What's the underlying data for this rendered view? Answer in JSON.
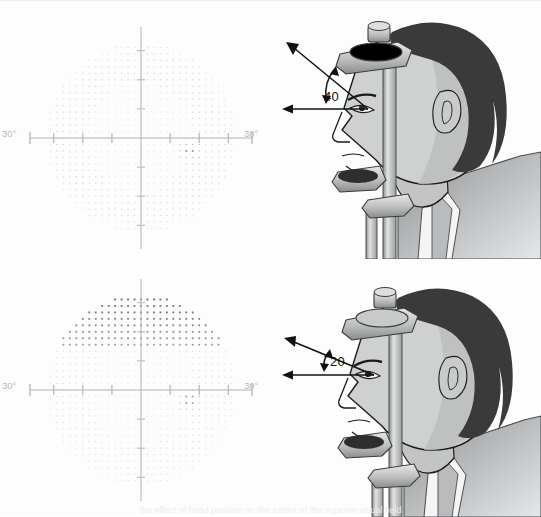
{
  "figure": {
    "background": "#fdfdfd",
    "caption_cut_off": "the effect of head position on the extent of the superior visual field"
  },
  "colors": {
    "axis": "#b4b4b4",
    "degree_label": "#b9b9b9",
    "dot_light": "#d8d8d8",
    "dot_mid": "#a8a8a8",
    "dot_dark": "#6e6e6e",
    "dot_darkest": "#4a4a4a",
    "skin": "#cfd0d0",
    "skin_shadow": "#a9abab",
    "hair": "#3a3a3a",
    "suit": "#9a9c9e",
    "shirt": "#f2f2f2",
    "metal_light": "#dcdcdc",
    "metal_mid": "#b0b2b2",
    "metal_dark": "#7d7f7f",
    "outline": "#1a1a1a",
    "annotation": "#111111"
  },
  "panels": [
    {
      "id": "top-left",
      "type": "visual-field-chart",
      "label_left": "30°",
      "label_right": "30°",
      "description": "Humphrey grayscale visual field plot, full normal field extent"
    },
    {
      "id": "top-right",
      "type": "head-illustration",
      "angle_value": "40",
      "description": "Patient at perimeter with chin and forehead rest, superior field extent 40 degrees"
    },
    {
      "id": "bottom-left",
      "type": "visual-field-chart",
      "label_left": "30°",
      "label_right": "30°",
      "description": "Humphrey grayscale visual field plot with stepped superior depression artifact"
    },
    {
      "id": "bottom-right",
      "type": "head-illustration",
      "angle_value": "20",
      "description": "Patient at perimeter with head tilted, superior field extent reduced to 20 degrees"
    }
  ],
  "chart_data": [
    {
      "id": "top-left-field",
      "type": "heatmap",
      "title": "",
      "xlabel": "",
      "ylabel": "",
      "xlim": [
        -30,
        30
      ],
      "ylim": [
        -30,
        30
      ],
      "grid": false,
      "axis_ticks_deg": [
        -27,
        -18,
        -9,
        9,
        18,
        27
      ],
      "tick_labels": [
        "30°",
        "30°"
      ],
      "radius_deg": 30,
      "point_spacing_deg": 2,
      "superior_defect": false,
      "superior_defect_rows": 0,
      "blind_spot": {
        "x_deg": 15,
        "y_deg": -4,
        "radius_deg": 5,
        "level": "dark"
      },
      "peripheral_shading": "light",
      "levels": {
        "background": 0.12,
        "mid_ring": 0.22,
        "blind_spot": 0.55,
        "inferior_nasal_patch": 0.32
      },
      "annotations": [
        {
          "text": "30°",
          "x_deg": -34,
          "y_deg": 0
        },
        {
          "text": "30°",
          "x_deg": 34,
          "y_deg": 0
        }
      ]
    },
    {
      "id": "bottom-left-field",
      "type": "heatmap",
      "title": "",
      "xlabel": "",
      "ylabel": "",
      "xlim": [
        -30,
        30
      ],
      "ylim": [
        -30,
        30
      ],
      "grid": false,
      "axis_ticks_deg": [
        -27,
        -18,
        -9,
        9,
        18,
        27
      ],
      "tick_labels": [
        "30°",
        "30°"
      ],
      "radius_deg": 30,
      "point_spacing_deg": 2,
      "superior_defect": true,
      "superior_defect_rows": 9,
      "superior_defect_top_deg": 30,
      "superior_defect_bottom_deg": 12,
      "superior_defect_shape": "stepped-pyramid",
      "blind_spot": {
        "x_deg": 15,
        "y_deg": -3,
        "radius_deg": 5,
        "level": "dark"
      },
      "peripheral_shading": "light",
      "levels": {
        "background": 0.12,
        "defect_dark": 0.78,
        "defect_mid": 0.45,
        "blind_spot": 0.5
      },
      "annotations": [
        {
          "text": "30°",
          "x_deg": -34,
          "y_deg": 0
        },
        {
          "text": "30°",
          "x_deg": 34,
          "y_deg": 0
        }
      ]
    }
  ]
}
